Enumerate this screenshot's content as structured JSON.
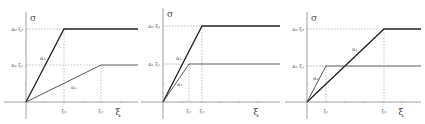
{
  "figure": {
    "header_fragment": "",
    "panels": [
      {
        "id": "panel-1",
        "y_label": "σ",
        "x_label": "ξ",
        "y_ticks": [
          "α₂ ξ₂",
          "α₁ ξ₁"
        ],
        "x_ticks": [
          "ξ₂",
          "ξ₁"
        ],
        "curve_labels": [
          "α₂",
          "α₁"
        ],
        "geom": {
          "ox": 26,
          "oy": 102,
          "xend": 138,
          "ytop": 12,
          "c2": {
            "kx": 64,
            "ky": 29
          },
          "c1": {
            "kx": 101,
            "ky": 65
          },
          "l2": {
            "x": 40,
            "y": 60
          },
          "l1": {
            "x": 71,
            "y": 89
          }
        }
      },
      {
        "id": "panel-2",
        "y_label": "σ",
        "x_label": "ξ",
        "y_ticks": [
          "α₂ ξ₂",
          "α₁ ξ₁"
        ],
        "x_ticks": [
          "ξ₁",
          "ξ₂"
        ],
        "curve_labels": [
          "α₂",
          "α₁"
        ],
        "geom": {
          "ox": 163,
          "oy": 102,
          "xend": 280,
          "ytop": 8,
          "c2": {
            "kx": 202,
            "ky": 26
          },
          "c1": {
            "kx": 189,
            "ky": 64
          },
          "l2": {
            "x": 176,
            "y": 60
          },
          "l1": {
            "x": 177,
            "y": 86
          }
        }
      },
      {
        "id": "panel-3",
        "y_label": "σ",
        "x_label": "ξ",
        "y_ticks": [
          "α₂ ξ₂",
          "α₁ ξ₁"
        ],
        "x_ticks": [
          "ξ₁",
          "ξ₂"
        ],
        "curve_labels": [
          "α₁",
          "α₂"
        ],
        "geom": {
          "ox": 307,
          "oy": 102,
          "xend": 421,
          "ytop": 12,
          "c2": {
            "kx": 384,
            "ky": 29
          },
          "c1": {
            "kx": 326,
            "ky": 66
          },
          "l2": {
            "x": 352,
            "y": 51
          },
          "l1": {
            "x": 313,
            "y": 80
          }
        }
      }
    ]
  }
}
